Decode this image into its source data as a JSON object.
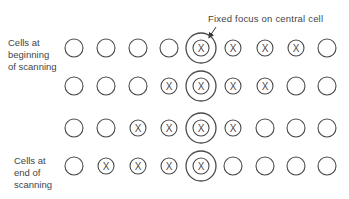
{
  "annotation": "Fixed focus on central cell",
  "labels": {
    "start": [
      "Cells at",
      "beginning",
      "of scanning"
    ],
    "end": [
      "Cells at",
      "end of",
      "scanning"
    ]
  },
  "grid": {
    "columns_x": [
      74,
      106,
      138,
      169,
      201,
      233,
      265,
      296,
      327
    ],
    "rows_y": [
      48,
      86,
      128,
      166
    ],
    "focus_column": 4,
    "rows": [
      [
        "empty",
        "empty",
        "empty",
        "empty",
        "marked",
        "marked",
        "marked",
        "marked",
        "empty"
      ],
      [
        "empty",
        "empty",
        "empty",
        "marked",
        "marked",
        "marked",
        "marked",
        "empty",
        "empty"
      ],
      [
        "empty",
        "empty",
        "marked",
        "marked",
        "marked",
        "marked",
        "empty",
        "empty",
        "empty"
      ],
      [
        "empty",
        "marked",
        "marked",
        "marked",
        "marked",
        "empty",
        "empty",
        "empty",
        "empty"
      ]
    ]
  },
  "colors": {
    "stroke": "#4a4a4a"
  }
}
